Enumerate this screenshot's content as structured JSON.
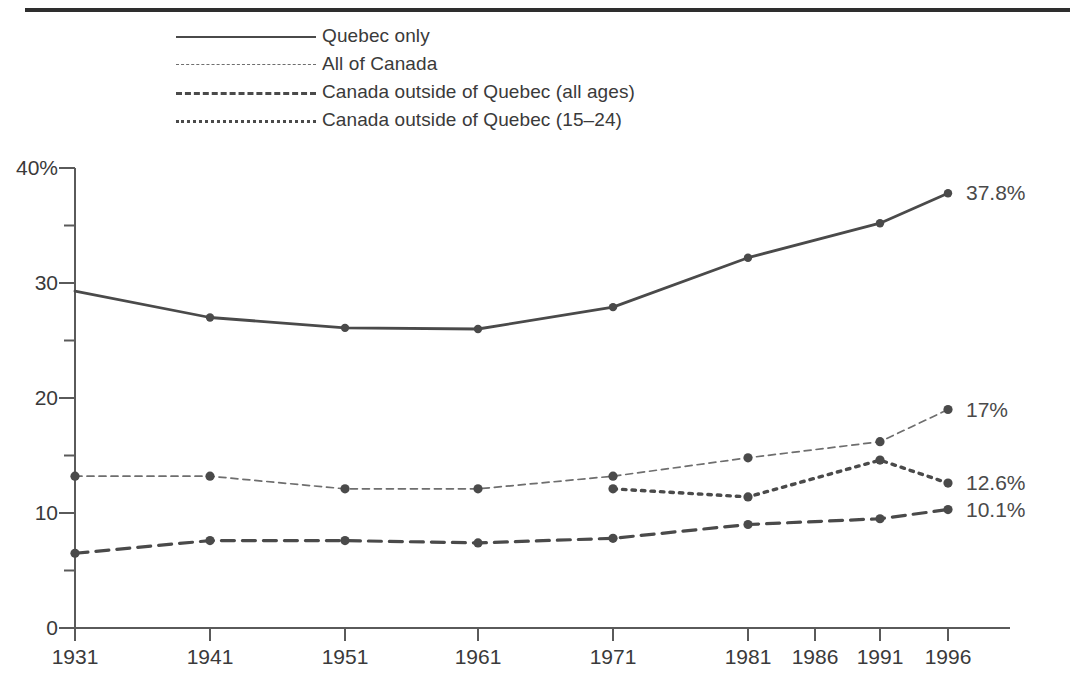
{
  "figure": {
    "top_rule": "horizontal-rule"
  },
  "legend": {
    "position": "top-left",
    "items": [
      {
        "label": "Quebec only",
        "style": "solid"
      },
      {
        "label": "All of Canada",
        "style": "fine-dashed"
      },
      {
        "label": "Canada outside of Quebec (all ages)",
        "style": "dashed"
      },
      {
        "label": "Canada outside of Quebec (15–24)",
        "style": "dotted"
      }
    ]
  },
  "chart_data": {
    "type": "line",
    "title": "",
    "subtitle": "",
    "xlabel": "",
    "ylabel": "",
    "grid": false,
    "legend_position": "top-left",
    "x": [
      "1931",
      "1941",
      "1951",
      "1961",
      "1971",
      "1981",
      "1986",
      "1991",
      "1996"
    ],
    "categories": [
      "1931",
      "1941",
      "1951",
      "1961",
      "1971",
      "1981",
      "1986",
      "1991",
      "1996"
    ],
    "ylim": [
      0,
      40
    ],
    "ytick_labels": [
      "40%",
      "30",
      "20",
      "10",
      "0"
    ],
    "ytick_values": [
      40,
      30,
      20,
      10,
      0
    ],
    "yminor_ticks": [
      35,
      25,
      15,
      5
    ],
    "xtick_labels": [
      "1931",
      "1941",
      "1951",
      "1961",
      "1971",
      "1981",
      "1986",
      "1991",
      "1996"
    ],
    "series": [
      {
        "name": "Quebec only",
        "style": "solid",
        "x": [
          "1931",
          "1941",
          "1951",
          "1961",
          "1971",
          "1981",
          "1991",
          "1996"
        ],
        "values": [
          29.3,
          27.0,
          26.1,
          26.0,
          27.9,
          32.2,
          35.2,
          37.8
        ],
        "end_label": "37.8%"
      },
      {
        "name": "All of Canada",
        "style": "fine-dashed",
        "x": [
          "1931",
          "1941",
          "1951",
          "1961",
          "1971",
          "1981",
          "1991",
          "1996"
        ],
        "values": [
          13.2,
          13.2,
          12.1,
          12.1,
          13.2,
          14.8,
          16.2,
          19.0
        ],
        "end_label": "17%"
      },
      {
        "name": "Canada outside of Quebec (15–24)",
        "style": "dotted",
        "x": [
          "1971",
          "1981",
          "1991",
          "1996"
        ],
        "values": [
          12.1,
          11.4,
          14.6,
          12.6
        ],
        "end_label": "12.6%"
      },
      {
        "name": "Canada outside of Quebec (all ages)",
        "style": "dashed",
        "x": [
          "1931",
          "1941",
          "1951",
          "1961",
          "1971",
          "1981",
          "1991",
          "1996"
        ],
        "values": [
          6.5,
          7.6,
          7.6,
          7.4,
          7.8,
          9.0,
          9.5,
          10.3
        ],
        "end_label": "10.1%"
      }
    ],
    "end_labels": [
      "37.8%",
      "17%",
      "12.6%",
      "10.1%"
    ],
    "colors": {
      "ink": "#4a4a4a",
      "fine": "#6e6e6e",
      "axis": "#5a5a5a",
      "text": "#3a3a3a"
    }
  }
}
